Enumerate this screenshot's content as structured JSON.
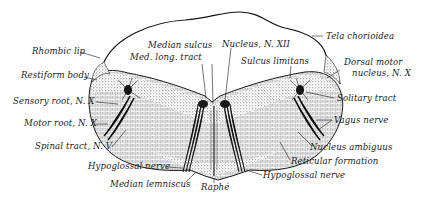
{
  "figure": {
    "colors": {
      "ink": "#1a1a1a",
      "paper": "#ffffff",
      "stipple": "#555555"
    }
  },
  "labels": {
    "rhombic_lip": "Rhombic lip",
    "restiform_body": "Restiform body",
    "sensory_root": "Sensory root, N. X",
    "motor_root": "Motor root, N. X",
    "spinal_tract": "Spinal tract, N. V",
    "hypoglossal_nerve_left": "Hypoglossal nerve",
    "median_lemniscus": "Median lemniscus",
    "raphe": "Raphé",
    "median_sulcus": "Median sulcus",
    "med_long_tract": "Med. long. tract",
    "nucleus_xii": "Nucleus, N. XII",
    "sulcus_limitans": "Sulcus limitans",
    "tela_chorioidea": "Tela chorioidea",
    "dorsal_motor_1": "Dorsal motor",
    "dorsal_motor_2": "nucleus, N. X",
    "solitary_tract": "Solitary tract",
    "vagus_nerve": "Vagus nerve",
    "nucleus_ambiguus": "Nucleus ambiguus",
    "reticular_formation": "Reticular formation",
    "hypoglossal_nerve_right": "Hypoglossal nerve"
  }
}
